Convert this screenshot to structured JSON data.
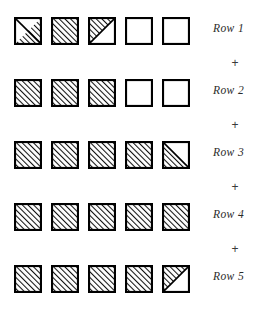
{
  "figure": {
    "title": "",
    "square_size": 28,
    "square_gap": 9,
    "colors": {
      "outline": "#000000",
      "hatch": "#111111",
      "background": "#ffffff",
      "label": "#2b2b2b"
    },
    "separator_symbol": "+",
    "rows": [
      {
        "label": "Row 1",
        "y": 17,
        "cells": [
          {
            "fill": "half-lower-right"
          },
          {
            "fill": "full"
          },
          {
            "fill": "half-upper-left"
          },
          {
            "fill": "empty"
          },
          {
            "fill": "empty"
          }
        ]
      },
      {
        "label": "Row 2",
        "y": 79,
        "cells": [
          {
            "fill": "full"
          },
          {
            "fill": "full"
          },
          {
            "fill": "full"
          },
          {
            "fill": "empty"
          },
          {
            "fill": "empty"
          }
        ]
      },
      {
        "label": "Row 3",
        "y": 141,
        "cells": [
          {
            "fill": "full"
          },
          {
            "fill": "full"
          },
          {
            "fill": "full"
          },
          {
            "fill": "full"
          },
          {
            "fill": "half-lower-left"
          }
        ]
      },
      {
        "label": "Row 4",
        "y": 203,
        "cells": [
          {
            "fill": "full"
          },
          {
            "fill": "full"
          },
          {
            "fill": "full"
          },
          {
            "fill": "full"
          },
          {
            "fill": "full"
          }
        ]
      },
      {
        "label": "Row 5",
        "y": 265,
        "cells": [
          {
            "fill": "full"
          },
          {
            "fill": "full"
          },
          {
            "fill": "full"
          },
          {
            "fill": "full"
          },
          {
            "fill": "half-upper-left"
          }
        ]
      }
    ],
    "separators": [
      {
        "symbol": "+",
        "y": 57
      },
      {
        "symbol": "+",
        "y": 119
      },
      {
        "symbol": "+",
        "y": 181
      },
      {
        "symbol": "+",
        "y": 243
      }
    ]
  }
}
